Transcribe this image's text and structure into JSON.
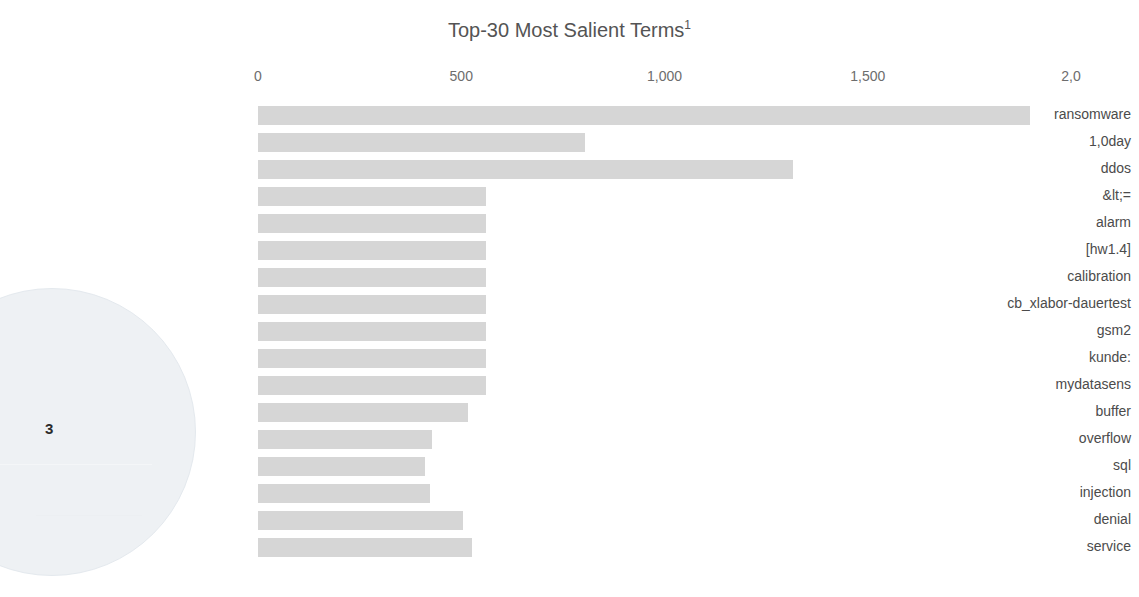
{
  "chart_data": {
    "type": "bar",
    "orientation": "horizontal",
    "title": "Top-30 Most Salient Terms",
    "title_superscript": "1",
    "xlabel": "",
    "ylabel": "",
    "xlim": [
      0,
      2050
    ],
    "xticks": [
      0,
      500,
      1000,
      1500,
      2000
    ],
    "xtick_labels": [
      "0",
      "500",
      "1,000",
      "1,500",
      "2,0"
    ],
    "grid": false,
    "legend": null,
    "bar_color": "#d6d6d6",
    "categories": [
      "ransomware",
      "1,0day",
      "ddos",
      "&lt;=",
      "alarm",
      "[hw1.4]",
      "calibration",
      "cb_xlabor-dauertest",
      "gsm2",
      "kunde:",
      "mydatasens",
      "buffer",
      "overflow",
      "sql",
      "injection",
      "denial",
      "service"
    ],
    "values": [
      1900,
      805,
      1315,
      560,
      560,
      562,
      562,
      562,
      562,
      562,
      562,
      517,
      428,
      411,
      424,
      505,
      527
    ],
    "note": "Values read from pixel positions against the 0/500/1,000/1,500 tick scale."
  },
  "topic_bubble": {
    "label": "3",
    "fill": "#eef1f4"
  },
  "icons": {
    "topic-circle": "topic-circle-icon"
  }
}
